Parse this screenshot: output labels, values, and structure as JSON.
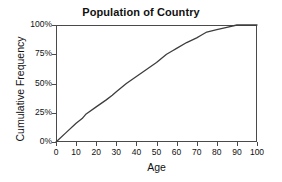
{
  "chart_data": {
    "type": "line",
    "title": "Population of Country",
    "xlabel": "Age",
    "ylabel": "Cumulative Frequency",
    "xlim": [
      0,
      100
    ],
    "ylim": [
      0,
      100
    ],
    "grid": false,
    "legend": "none",
    "line_color": "#3d3d3d",
    "xticks": [
      0,
      10,
      20,
      30,
      40,
      50,
      60,
      70,
      80,
      90,
      100
    ],
    "xtick_labels": [
      "0",
      "10",
      "20",
      "30",
      "40",
      "50",
      "60",
      "70",
      "80",
      "90",
      "100"
    ],
    "yticks": [
      0,
      25,
      50,
      75,
      100
    ],
    "ytick_labels": [
      "0%",
      "25%",
      "50%",
      "75%",
      "100%"
    ],
    "series": [
      {
        "name": "Cumulative Frequency",
        "x": [
          0,
          5,
          10,
          13,
          15,
          20,
          25,
          28,
          30,
          35,
          40,
          45,
          50,
          55,
          58,
          60,
          65,
          70,
          72,
          75,
          80,
          85,
          90,
          95,
          100
        ],
        "values": [
          0,
          8,
          16,
          20,
          24,
          30,
          36,
          40,
          43,
          50,
          56,
          62,
          68,
          75,
          78,
          80,
          85,
          89,
          91,
          94,
          96,
          98,
          100,
          100,
          100
        ]
      }
    ]
  },
  "chart": {
    "title": "Population of Country",
    "xlabel": "Age",
    "ylabel": "Cumulative Frequency"
  }
}
